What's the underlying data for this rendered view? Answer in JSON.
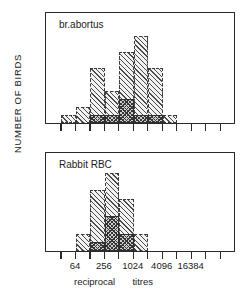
{
  "figure": {
    "ylabel": "NUMBER OF BIRDS",
    "xlabel_part1": "reciprocal",
    "xlabel_part2": "titres"
  },
  "chart_data": [
    {
      "type": "bar",
      "title": "br.abortus",
      "xlabel": "reciprocal titres",
      "ylabel": "NUMBER OF BIRDS",
      "ylim": [
        0,
        11.8
      ],
      "yticks": [
        2,
        4,
        6,
        8,
        10
      ],
      "ytick_labels": [
        "2",
        "4",
        "6",
        "8",
        "10"
      ],
      "grid": false,
      "x_scale": "log2-bins",
      "bin_index": [
        0,
        1,
        2,
        3,
        4,
        5,
        6,
        7,
        8,
        9,
        10,
        11,
        12
      ],
      "xticks_labeled": [
        64,
        256,
        1024,
        4096,
        16384
      ],
      "series": [
        {
          "name": "light-hatched",
          "fill": "diagonal-hatch",
          "bin_start": 1,
          "values": [
            1,
            2,
            7,
            4,
            9,
            11,
            7,
            1
          ]
        },
        {
          "name": "dark-checkered",
          "fill": "cross-hatch",
          "bin_start": 3,
          "values": [
            1,
            1,
            3,
            1,
            1
          ]
        }
      ]
    },
    {
      "type": "bar",
      "title": "Rabbit RBC",
      "xlabel": "reciprocal titres",
      "ylabel": "NUMBER OF BIRDS",
      "ylim": [
        0,
        9.6
      ],
      "yticks": [
        2,
        4,
        6,
        8
      ],
      "ytick_labels": [
        "2",
        "4",
        "6",
        "8"
      ],
      "grid": false,
      "x_scale": "log2-bins",
      "bin_index": [
        0,
        1,
        2,
        3,
        4,
        5,
        6,
        7,
        8,
        9,
        10,
        11,
        12
      ],
      "xticks_labeled": [
        64,
        256,
        1024,
        4096,
        16384
      ],
      "series": [
        {
          "name": "light-hatched",
          "fill": "diagonal-hatch",
          "bin_start": 2,
          "values": [
            2,
            7,
            9,
            6,
            2
          ]
        },
        {
          "name": "dark-checkered",
          "fill": "cross-hatch",
          "bin_start": 3,
          "values": [
            1,
            4,
            2
          ]
        }
      ]
    }
  ],
  "xaxis": {
    "tick_labels": [
      "64",
      "256",
      "1024",
      "4096",
      "16384"
    ],
    "tick_bins": [
      2,
      4,
      6,
      8,
      10
    ],
    "n_bins": 13
  }
}
